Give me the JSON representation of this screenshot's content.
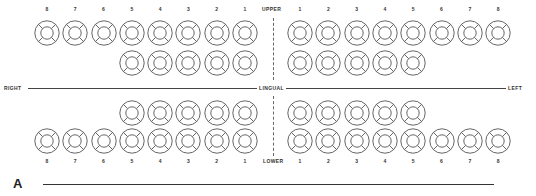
{
  "diagram": {
    "title_letter": "A",
    "labels": {
      "upper": "UPPER",
      "lower": "LOWER",
      "right": "RIGHT",
      "left": "LEFT",
      "lingual": "LINGUAL"
    },
    "tooth_numbers_full": [
      "1",
      "2",
      "3",
      "4",
      "5",
      "6",
      "7",
      "8"
    ],
    "quadrants": {
      "upper_right": {
        "outer_row": [
          "8",
          "7",
          "6",
          "5",
          "4",
          "3",
          "2",
          "1"
        ],
        "inner_row": [
          "5",
          "4",
          "3",
          "2",
          "1"
        ]
      },
      "upper_left": {
        "outer_row": [
          "1",
          "2",
          "3",
          "4",
          "5",
          "6",
          "7",
          "8"
        ],
        "inner_row": [
          "1",
          "2",
          "3",
          "4",
          "5"
        ]
      },
      "lower_right": {
        "inner_row": [
          "5",
          "4",
          "3",
          "2",
          "1"
        ],
        "outer_row": [
          "8",
          "7",
          "6",
          "5",
          "4",
          "3",
          "2",
          "1"
        ]
      },
      "lower_left": {
        "inner_row": [
          "1",
          "2",
          "3",
          "4",
          "5"
        ],
        "outer_row": [
          "1",
          "2",
          "3",
          "4",
          "5",
          "6",
          "7",
          "8"
        ]
      }
    },
    "tooth_symbol": "four-surface-ring",
    "colors": {
      "stroke": "#555555",
      "background": "#ffffff"
    }
  }
}
